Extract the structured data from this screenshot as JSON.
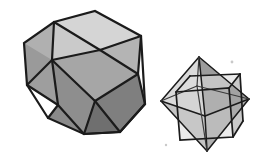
{
  "figure": {
    "background_color": "#ffffff",
    "width": 267,
    "height": 162,
    "caption": "",
    "objects": [
      {
        "name": "cuboctahedron",
        "label": "",
        "position": "left",
        "outline_color": "#1b1b1b",
        "outline_width": 2.2
      },
      {
        "name": "cube-octahedron-compound",
        "label": "",
        "position": "right",
        "outline_color": "#1b1b1b",
        "outline_width": 1.6
      }
    ]
  },
  "palette": {
    "ink": "#1b1b1b",
    "ink_soft": "#3a3a3a",
    "face_highlight": "#e0e0e0",
    "face_light": "#d5d5d5",
    "face_light_2": "#cacaca",
    "face_mid": "#b4b4b4",
    "face_mid_2": "#a6a6a6",
    "face_shade": "#949494",
    "face_shade_2": "#888888",
    "face_dark": "#7a7a7a",
    "face_darkest": "#6a6a6a",
    "paper": "#ffffff",
    "speck": "#c9c9c9"
  },
  "cuboctahedron": {
    "faces": [
      {
        "id": "top-square",
        "shape": "square",
        "tone": "#d5d5d5",
        "points": "54,22 95,11 141,36 100,50"
      },
      {
        "id": "upper-left-tri",
        "shape": "triangle",
        "tone": "#cacaca",
        "points": "54,22 100,50 52,60"
      },
      {
        "id": "upper-right-tri",
        "shape": "triangle",
        "tone": "#b4b4b4",
        "points": "141,36 138,74 100,50"
      },
      {
        "id": "front-square",
        "shape": "square",
        "tone": "#a6a6a6",
        "points": "52,60 100,50 138,74 95,101"
      },
      {
        "id": "left-square",
        "shape": "square",
        "tone": "#9a9a9a",
        "points": "24,43 54,22 52,60 27,85"
      },
      {
        "id": "left-upper-tri",
        "shape": "triangle",
        "tone": "#b0b0b0",
        "points": "24,43 54,22 52,60"
      },
      {
        "id": "lower-left-tri",
        "shape": "triangle",
        "tone": "#9e9e9e",
        "points": "27,85 52,60 58,105"
      },
      {
        "id": "bottom-left-square",
        "shape": "square",
        "tone": "#8e8e8e",
        "points": "52,60 95,101 84,134 58,105"
      },
      {
        "id": "bottom-tri",
        "shape": "triangle",
        "tone": "#8a8a8a",
        "points": "58,105 84,134 48,118"
      },
      {
        "id": "bottom-right-sq",
        "shape": "square",
        "tone": "#7f7f7f",
        "points": "95,101 138,74 145,104 120,132"
      },
      {
        "id": "bottom-front-tri",
        "shape": "triangle",
        "tone": "#6f6f6f",
        "points": "95,101 120,132 84,134"
      },
      {
        "id": "right-lower-tri",
        "shape": "triangle",
        "tone": "#777777",
        "points": "138,74 145,104 120,132"
      }
    ],
    "edges": [
      "54,22 95,11",
      "95,11 141,36",
      "141,36 100,50",
      "100,50 54,22",
      "54,22 24,43",
      "24,43 27,85",
      "27,85 52,60",
      "52,60 54,22",
      "52,60 100,50",
      "100,50 138,74",
      "138,74 141,36",
      "52,60 95,101",
      "95,101 138,74",
      "27,85 58,105",
      "58,105 52,60",
      "58,105 84,134",
      "84,134 95,101",
      "58,105 48,118",
      "48,118 84,134",
      "84,134 120,132",
      "120,132 95,101",
      "120,132 145,104",
      "145,104 138,74",
      "145,104 141,36"
    ]
  },
  "compound": {
    "octahedron": {
      "apex_top": "199,57",
      "apex_bottom": "207,151",
      "left": "161,101",
      "right": "249,99",
      "front": "205,116",
      "back": "197,86",
      "faces": [
        {
          "id": "oct-top-left",
          "tone": "#dadada",
          "points": "199,57 161,101 205,116"
        },
        {
          "id": "oct-top-right",
          "tone": "#9c9c9c",
          "points": "199,57 205,116 249,99"
        },
        {
          "id": "oct-bot-left",
          "tone": "#c4c4c4",
          "points": "207,151 161,101 205,116"
        },
        {
          "id": "oct-bot-right",
          "tone": "#b0b0b0",
          "points": "207,151 205,116 249,99"
        }
      ]
    },
    "cube": {
      "front_face": "176,92 229,88 233,137 180,140",
      "top_face": "176,92 190,76 240,74 229,88",
      "right_face": "229,88 240,74 243,121 233,137",
      "tone_front": "#cdcdcd",
      "tone_top": "#dddddd",
      "tone_right": "#a8a8a8"
    },
    "edges": [
      "199,57 161,101",
      "199,57 249,99",
      "207,151 161,101",
      "207,151 249,99",
      "161,101 205,116",
      "205,116 249,99",
      "199,57 205,116",
      "207,151 205,116",
      "176,92 229,88",
      "229,88 233,137",
      "233,137 180,140",
      "180,140 176,92",
      "176,92 190,76",
      "190,76 240,74",
      "240,74 229,88",
      "240,74 243,121",
      "243,121 233,137"
    ]
  },
  "artifacts": {
    "specks": [
      {
        "name": "speck-upper-right",
        "x": 232,
        "y": 62,
        "r": 1.4
      },
      {
        "name": "speck-lower-left",
        "x": 166,
        "y": 145,
        "r": 1.2
      }
    ]
  }
}
